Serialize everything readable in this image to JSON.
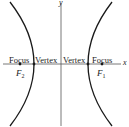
{
  "diagram": {
    "type": "hyperbola",
    "axes": {
      "x_label": "x",
      "y_label": "y"
    },
    "labels": {
      "focus_left": "Focus",
      "vertex_left": "Vertex",
      "vertex_right": "Vertex",
      "focus_right": "Focus",
      "f2_main": "F",
      "f2_sub": "2",
      "f1_main": "F",
      "f1_sub": "1"
    },
    "colors": {
      "curve": "#1a1a1a",
      "axis": "#444444",
      "text": "#222222"
    }
  }
}
